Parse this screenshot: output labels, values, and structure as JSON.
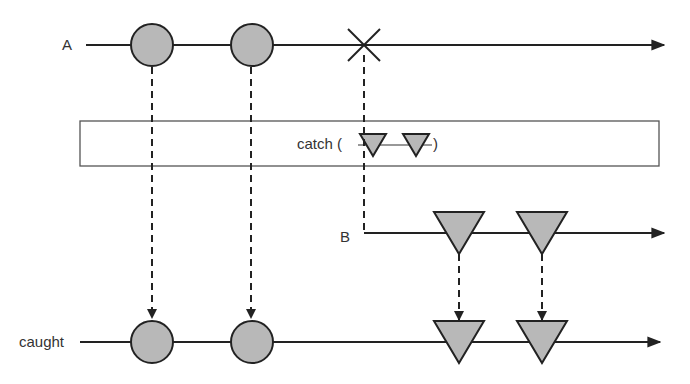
{
  "diagram": {
    "type": "marble-diagram",
    "operator": {
      "label_prefix": "catch (",
      "label_suffix": ")",
      "box": {
        "x": 80,
        "y": 121,
        "w": 579,
        "h": 45
      },
      "inner_marbles": [
        {
          "shape": "triangle",
          "cx": 373
        },
        {
          "shape": "triangle",
          "cx": 416
        }
      ],
      "inner_line": {
        "x1": 358,
        "x2": 432,
        "y": 145
      }
    },
    "streams": [
      {
        "name": "A",
        "y": 45,
        "x_start": 86,
        "x_end": 664,
        "events": [
          {
            "type": "circle",
            "x": 152
          },
          {
            "type": "circle",
            "x": 252
          },
          {
            "type": "error",
            "x": 364
          }
        ]
      },
      {
        "name": "B",
        "y": 233,
        "x_start": 364,
        "x_end": 664,
        "events": [
          {
            "type": "triangle",
            "x": 459
          },
          {
            "type": "triangle",
            "x": 542
          }
        ]
      },
      {
        "name": "caught",
        "y": 342,
        "x_start": 80,
        "x_end": 660,
        "events": [
          {
            "type": "circle",
            "x": 152
          },
          {
            "type": "circle",
            "x": 252
          },
          {
            "type": "triangle",
            "x": 459
          },
          {
            "type": "triangle",
            "x": 542
          }
        ]
      }
    ],
    "colors": {
      "stroke": "#222222",
      "marble_fill": "#b8b8b8",
      "box_stroke": "#555555",
      "text": "#333333"
    }
  }
}
